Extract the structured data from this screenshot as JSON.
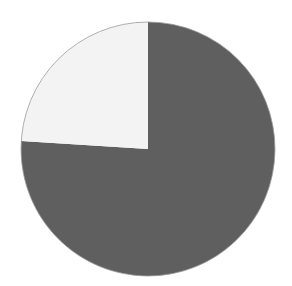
{
  "chart_data": {
    "type": "pie",
    "title": "",
    "categories": [
      "Dark slice",
      "Light slice"
    ],
    "values": [
      76,
      24
    ],
    "colors": [
      "#5f5f5f",
      "#f3f3f3"
    ],
    "start_angle_deg": -90,
    "direction": "counterclockwise-for-light-slice",
    "legend": "none",
    "labels_shown": false
  },
  "colors": {
    "background": "#ffffff",
    "outline": "#9a9a9a"
  }
}
